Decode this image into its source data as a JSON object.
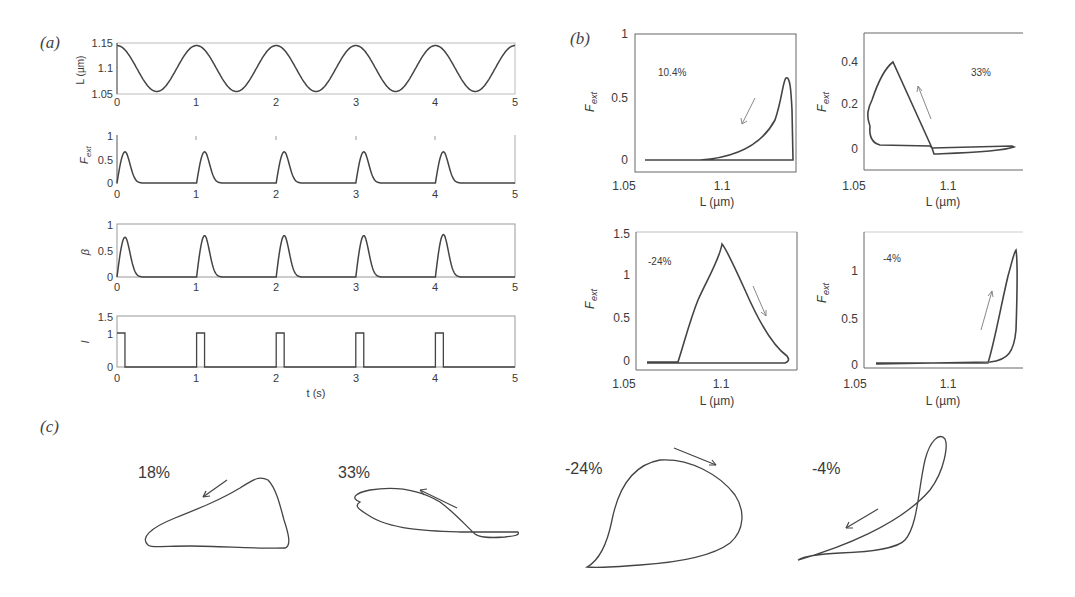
{
  "figure": {
    "panel_labels": [
      "(a)",
      "(b)",
      "(c)"
    ]
  },
  "chart_data": [
    {
      "id": "a1",
      "type": "line",
      "panel": "a",
      "ylabel": "L (µm)",
      "xlabel": "",
      "xlim": [
        0,
        5
      ],
      "ylim": [
        1.05,
        1.15
      ],
      "xticks": [
        "0",
        "1",
        "2",
        "3",
        "4",
        "5"
      ],
      "yticks": [
        "1.05",
        "1.1",
        "1.15"
      ],
      "description": "sinusoid, period 1 s, max 1.145 at integer t, min 1.055 at t+0.5",
      "series": [
        {
          "name": "L",
          "amplitude": 0.045,
          "mean": 1.1,
          "period": 1
        }
      ]
    },
    {
      "id": "a2",
      "type": "line",
      "panel": "a",
      "ylabel": "F_ext",
      "xlim": [
        0,
        5
      ],
      "ylim": [
        0,
        1
      ],
      "xticks": [
        "0",
        "1",
        "2",
        "3",
        "4",
        "5"
      ],
      "yticks": [
        "0",
        "0.5",
        "1"
      ],
      "series": [
        {
          "name": "F_ext",
          "peak_times": [
            0.1,
            1.1,
            2.1,
            3.1,
            4.1
          ],
          "peak_values": [
            0.65,
            0.65,
            0.65,
            0.65,
            0.65
          ]
        }
      ]
    },
    {
      "id": "a3",
      "type": "line",
      "panel": "a",
      "ylabel": "β",
      "xlim": [
        0,
        5
      ],
      "ylim": [
        0,
        1
      ],
      "xticks": [
        "0",
        "1",
        "2",
        "3",
        "4",
        "5"
      ],
      "yticks": [
        "0",
        "0.5",
        "1"
      ],
      "series": [
        {
          "name": "beta",
          "peak_times": [
            0.1,
            1.1,
            2.1,
            3.1,
            4.1
          ],
          "peak_values": [
            0.75,
            0.78,
            0.78,
            0.78,
            0.8
          ]
        }
      ]
    },
    {
      "id": "a4",
      "type": "line",
      "panel": "a",
      "ylabel": "I",
      "xlabel": "t (s)",
      "xlim": [
        0,
        5
      ],
      "ylim": [
        0,
        1.5
      ],
      "xticks": [
        "0",
        "1",
        "2",
        "3",
        "4",
        "5"
      ],
      "yticks": [
        "0",
        "1",
        "1.5"
      ],
      "series": [
        {
          "name": "I",
          "pulse_starts": [
            0,
            1,
            2,
            3,
            4
          ],
          "pulse_width": 0.1,
          "pulse_height": 1
        }
      ]
    },
    {
      "id": "b1",
      "type": "line",
      "panel": "b",
      "annotation": "10.4%",
      "xlabel": "L (µm)",
      "ylabel": "F_ext",
      "xlim": [
        1.05,
        1.15
      ],
      "ylim": [
        -0.05,
        1
      ],
      "xticks": [
        "1.05",
        "1.1"
      ],
      "yticks": [
        "0",
        "0.5",
        "1"
      ],
      "peak": {
        "L": 1.13,
        "F": 0.65
      }
    },
    {
      "id": "b2",
      "type": "line",
      "panel": "b",
      "annotation": "33%",
      "xlabel": "L (µm)",
      "ylabel": "F_ext",
      "xlim": [
        1.05,
        1.15
      ],
      "ylim": [
        -0.05,
        0.5
      ],
      "xticks": [
        "1.05",
        "1.1"
      ],
      "yticks": [
        "0",
        "0.2",
        "0.4"
      ],
      "peak": {
        "L": 1.068,
        "F": 0.37
      }
    },
    {
      "id": "b3",
      "type": "line",
      "panel": "b",
      "annotation": "-24%",
      "xlabel": "L (µm)",
      "ylabel": "F_ext",
      "xlim": [
        1.05,
        1.15
      ],
      "ylim": [
        -0.05,
        1.5
      ],
      "xticks": [
        "1.05",
        "1.1"
      ],
      "yticks": [
        "0",
        "0.5",
        "1",
        "1.5"
      ],
      "peak": {
        "L": 1.101,
        "F": 1.37
      }
    },
    {
      "id": "b4",
      "type": "line",
      "panel": "b",
      "annotation": "-4%",
      "xlabel": "L (µm)",
      "ylabel": "F_ext",
      "xlim": [
        1.05,
        1.15
      ],
      "ylim": [
        -0.02,
        1.4
      ],
      "xticks": [
        "1.05",
        "1.1"
      ],
      "yticks": [
        "0",
        "0.5",
        "1"
      ],
      "peak": {
        "L": 1.142,
        "F": 1.2
      }
    },
    {
      "id": "c",
      "type": "line",
      "panel": "c",
      "loops": [
        "18%",
        "33%",
        "-24%",
        "-4%"
      ]
    }
  ],
  "text": {
    "a1_ylabel": "L (µm)",
    "a2_ylabel": "F",
    "a2_ylabel_sub": "ext",
    "a3_ylabel": "β",
    "a4_ylabel": "I",
    "a4_xlabel": "t (s)",
    "b_xlabel": "L (µm)",
    "b_ylabel": "F",
    "b_ylabel_sub": "ext",
    "b1_pct": "10.4%",
    "b2_pct": "33%",
    "b3_pct": "-24%",
    "b4_pct": "-4%",
    "c1_pct": "18%",
    "c2_pct": "33%",
    "c3_pct": "-24%",
    "c4_pct": "-4%",
    "x_0": "0",
    "x_1": "1",
    "x_2": "2",
    "x_3": "3",
    "x_4": "4",
    "x_5": "5",
    "a1_y0": "1.05",
    "a1_y1": "1.1",
    "a1_y2": "1.15",
    "y_0": "0",
    "y_05": "0.5",
    "y_1": "1",
    "y_15": "1.5",
    "y_02": "0.2",
    "y_04": "0.4",
    "bx_0": "1.05",
    "bx_1": "1.1"
  }
}
